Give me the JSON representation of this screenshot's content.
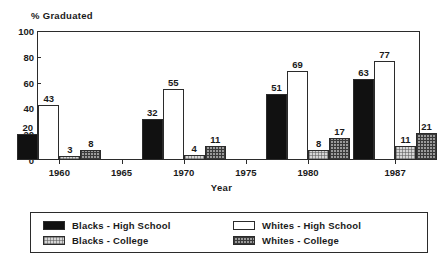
{
  "chart_data": {
    "type": "bar",
    "title": "",
    "ylabel": "% Graduated",
    "xlabel": "Year",
    "ylim": [
      0,
      100
    ],
    "yticks": [
      0,
      20,
      40,
      60,
      80,
      100
    ],
    "xticks": [
      "1960",
      "1965",
      "1970",
      "1975",
      "1980",
      "1987"
    ],
    "categories": [
      "1960",
      "1970",
      "1980",
      "1987"
    ],
    "grid": false,
    "legend_position": "bottom",
    "series": [
      {
        "name": "Blacks - High School",
        "key": "black-hs",
        "values": [
          20,
          32,
          51,
          63
        ]
      },
      {
        "name": "Whites - High School",
        "key": "white-hs",
        "values": [
          43,
          55,
          69,
          77
        ]
      },
      {
        "name": "Blacks - College",
        "key": "black-col",
        "values": [
          3,
          4,
          8,
          11
        ]
      },
      {
        "name": "Whites - College",
        "key": "white-col",
        "values": [
          8,
          11,
          17,
          21
        ]
      }
    ]
  },
  "legend": {
    "items": [
      {
        "label": "Blacks - High School",
        "swatch": "black-hs"
      },
      {
        "label": "Blacks - College",
        "swatch": "black-col"
      },
      {
        "label": "Whites - High School",
        "swatch": "white-hs"
      },
      {
        "label": "Whites - College",
        "swatch": "white-col"
      }
    ]
  },
  "colors": {
    "axis": "#2b2b2b",
    "black_high_school": "#111111",
    "white_high_school": "#ffffff",
    "black_college": "#d6d6d6",
    "white_college": "#9a9a9a",
    "background": "#ffffff"
  }
}
